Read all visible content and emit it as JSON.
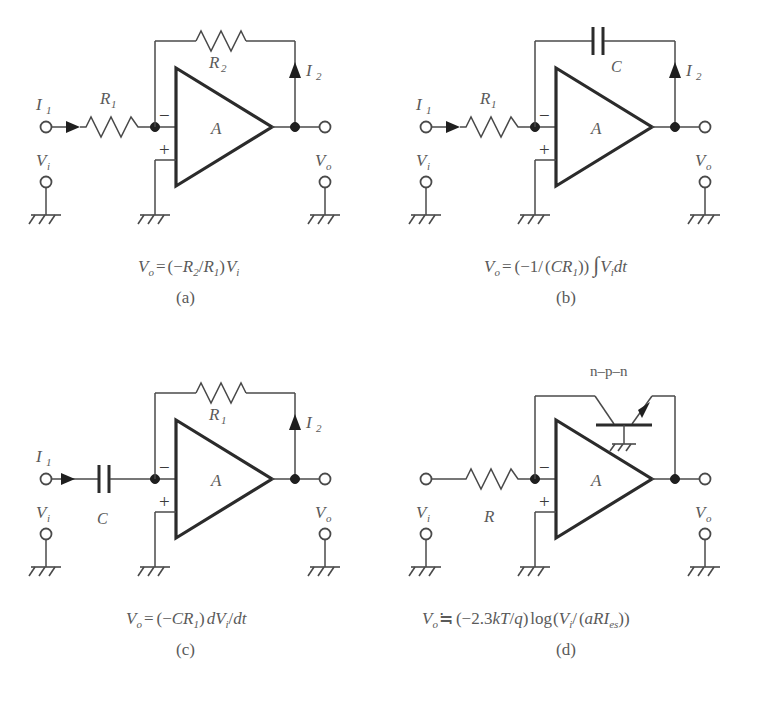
{
  "figure": {
    "background": "#ffffff",
    "line_color": "#4a4a4a",
    "text_color": "#5a5a5a"
  },
  "panels": [
    {
      "key": "a",
      "caption": "(a)",
      "equation": "V_o = (-R_2/R_1) V_i",
      "equation_parts": {
        "lhs_var": "V",
        "lhs_sub": "o",
        "eq": "=",
        "open": "(",
        "minus": "−",
        "num": "R",
        "num_sub": "2",
        "slash": "/",
        "den": "R",
        "den_sub": "1",
        "close": ")",
        "rhs_var": "V",
        "rhs_sub": "i"
      },
      "amp_label": "A",
      "input_current": "I",
      "input_current_sub": "1",
      "feedback_current": "I",
      "feedback_current_sub": "2",
      "input_component": "R",
      "input_component_sub": "1",
      "input_component_type": "resistor",
      "feedback_component": "R",
      "feedback_component_sub": "2",
      "feedback_component_type": "resistor",
      "input_voltage": "V",
      "input_voltage_sub": "i",
      "output_voltage": "V",
      "output_voltage_sub": "o",
      "inverting_sign": "−",
      "noninverting_sign": "+",
      "has_transistor": false,
      "transistor_label": ""
    },
    {
      "key": "b",
      "caption": "(b)",
      "equation": "V_o = (-1/(CR_1)) ∫ V_i dt",
      "equation_parts": {
        "lhs_var": "V",
        "lhs_sub": "o",
        "eq": "=",
        "open": "(",
        "minus": "−",
        "one": "1",
        "slash": "/",
        "open2": "(",
        "c": "C",
        "r": "R",
        "r_sub": "1",
        "close2": ")",
        "close": ")",
        "integral": "∫",
        "rhs_var": "V",
        "rhs_sub": "i",
        "dt": "dt"
      },
      "amp_label": "A",
      "input_current": "I",
      "input_current_sub": "1",
      "feedback_current": "I",
      "feedback_current_sub": "2",
      "input_component": "R",
      "input_component_sub": "1",
      "input_component_type": "resistor",
      "feedback_component": "C",
      "feedback_component_sub": "",
      "feedback_component_type": "capacitor",
      "input_voltage": "V",
      "input_voltage_sub": "i",
      "output_voltage": "V",
      "output_voltage_sub": "o",
      "inverting_sign": "−",
      "noninverting_sign": "+",
      "has_transistor": false,
      "transistor_label": ""
    },
    {
      "key": "c",
      "caption": "(c)",
      "equation": "V_o = (-CR_1) dV_i/dt",
      "equation_parts": {
        "lhs_var": "V",
        "lhs_sub": "o",
        "eq": "=",
        "open": "(",
        "minus": "−",
        "c": "C",
        "r": "R",
        "r_sub": "1",
        "close": ")",
        "d": "d",
        "rhs_var": "V",
        "rhs_sub": "i",
        "slash": "/",
        "dt": "dt"
      },
      "amp_label": "A",
      "input_current": "I",
      "input_current_sub": "1",
      "feedback_current": "I",
      "feedback_current_sub": "2",
      "input_component": "C",
      "input_component_sub": "",
      "input_component_type": "capacitor",
      "feedback_component": "R",
      "feedback_component_sub": "1",
      "feedback_component_type": "resistor",
      "input_voltage": "V",
      "input_voltage_sub": "i",
      "output_voltage": "V",
      "output_voltage_sub": "o",
      "inverting_sign": "−",
      "noninverting_sign": "+",
      "has_transistor": false,
      "transistor_label": ""
    },
    {
      "key": "d",
      "caption": "(d)",
      "equation": "V_o ≐ (-2.3kT/q) log(V_i/(aRI_es))",
      "equation_parts": {
        "lhs_var": "V",
        "lhs_sub": "o",
        "eq": "≒",
        "open": "(",
        "minus": "−",
        "const": "2.3",
        "k": "k",
        "t": "T",
        "slash": "/",
        "q": "q",
        "close": ")",
        "log": "log",
        "open2": "(",
        "rhs_var": "V",
        "rhs_sub": "i",
        "slash2": "/",
        "open3": "(",
        "a": "a",
        "r": "R",
        "i": "I",
        "i_sub": "es",
        "close3": ")",
        "close2": ")"
      },
      "amp_label": "A",
      "input_current": "",
      "input_current_sub": "",
      "feedback_current": "",
      "feedback_current_sub": "",
      "input_component": "R",
      "input_component_sub": "",
      "input_component_type": "resistor",
      "feedback_component": "",
      "feedback_component_sub": "",
      "feedback_component_type": "transistor",
      "input_voltage": "V",
      "input_voltage_sub": "i",
      "output_voltage": "V",
      "output_voltage_sub": "o",
      "inverting_sign": "−",
      "noninverting_sign": "+",
      "has_transistor": true,
      "transistor_label": "n–p–n"
    }
  ]
}
